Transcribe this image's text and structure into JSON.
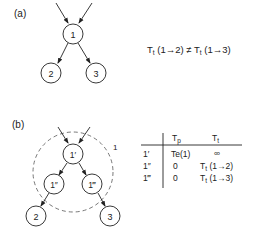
{
  "panel_a": {
    "label": "(a)",
    "nodes": [
      {
        "id": "1",
        "label": "1"
      },
      {
        "id": "2",
        "label": "2"
      },
      {
        "id": "3",
        "label": "3"
      }
    ],
    "equation": {
      "lhs_symbol": "T",
      "lhs_sub": "t",
      "lhs_arg": "(1→2)",
      "relation": "≠",
      "rhs_symbol": "T",
      "rhs_sub": "t",
      "rhs_arg": "(1→3)"
    }
  },
  "panel_b": {
    "label": "(b)",
    "group_label": "1",
    "nodes": [
      {
        "id": "1p",
        "label": "1′"
      },
      {
        "id": "1pp",
        "label": "1″"
      },
      {
        "id": "1ppp",
        "label": "1‴"
      },
      {
        "id": "2",
        "label": "2"
      },
      {
        "id": "3",
        "label": "3"
      }
    ],
    "table": {
      "headers": [
        "",
        "Tp",
        "Tt"
      ],
      "header_tp": {
        "symbol": "T",
        "sub": "p"
      },
      "header_tt": {
        "symbol": "T",
        "sub": "t"
      },
      "rows": [
        {
          "node": "1′",
          "tp": "Te(1)",
          "tt": "∞"
        },
        {
          "node": "1″",
          "tp": "0",
          "tt_symbol": "T",
          "tt_sub": "t",
          "tt_arg": "(1→2)"
        },
        {
          "node": "1‴",
          "tp": "0",
          "tt_symbol": "T",
          "tt_sub": "t",
          "tt_arg": "(1→3)"
        }
      ]
    }
  }
}
